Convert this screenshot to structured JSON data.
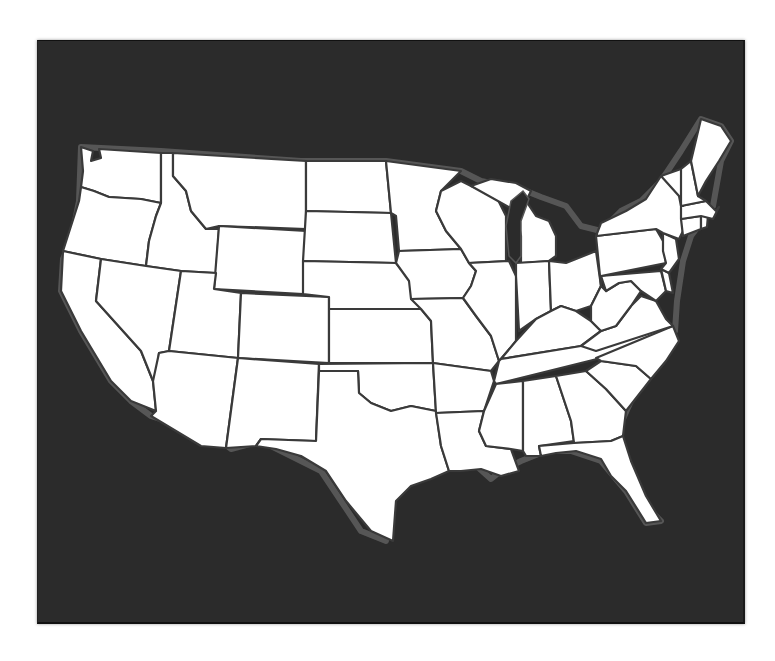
{
  "map": {
    "type": "blank-outline",
    "subject": "Contiguous United States",
    "labels_visible": false,
    "colors": {
      "page_background": "#ffffff",
      "board_background": "#2b2b2b",
      "land_fill": "#ffffff",
      "border_stroke": "#3a3a3a",
      "coast_halo": "#7a7a7a"
    },
    "regions": [
      "Washington",
      "Oregon",
      "California",
      "Idaho",
      "Nevada",
      "Montana",
      "Wyoming",
      "Utah",
      "Arizona",
      "Colorado",
      "New Mexico",
      "North Dakota",
      "South Dakota",
      "Nebraska",
      "Kansas",
      "Oklahoma",
      "Texas",
      "Minnesota",
      "Iowa",
      "Missouri",
      "Arkansas",
      "Louisiana",
      "Wisconsin",
      "Illinois",
      "Michigan",
      "Indiana",
      "Ohio",
      "Kentucky",
      "Tennessee",
      "Mississippi",
      "Alabama",
      "Georgia",
      "Florida",
      "South Carolina",
      "North Carolina",
      "Virginia",
      "West Virginia",
      "Maryland",
      "Delaware",
      "Pennsylvania",
      "New Jersey",
      "New York",
      "Connecticut",
      "Rhode Island",
      "Massachusetts",
      "Vermont",
      "New Hampshire",
      "Maine"
    ]
  }
}
